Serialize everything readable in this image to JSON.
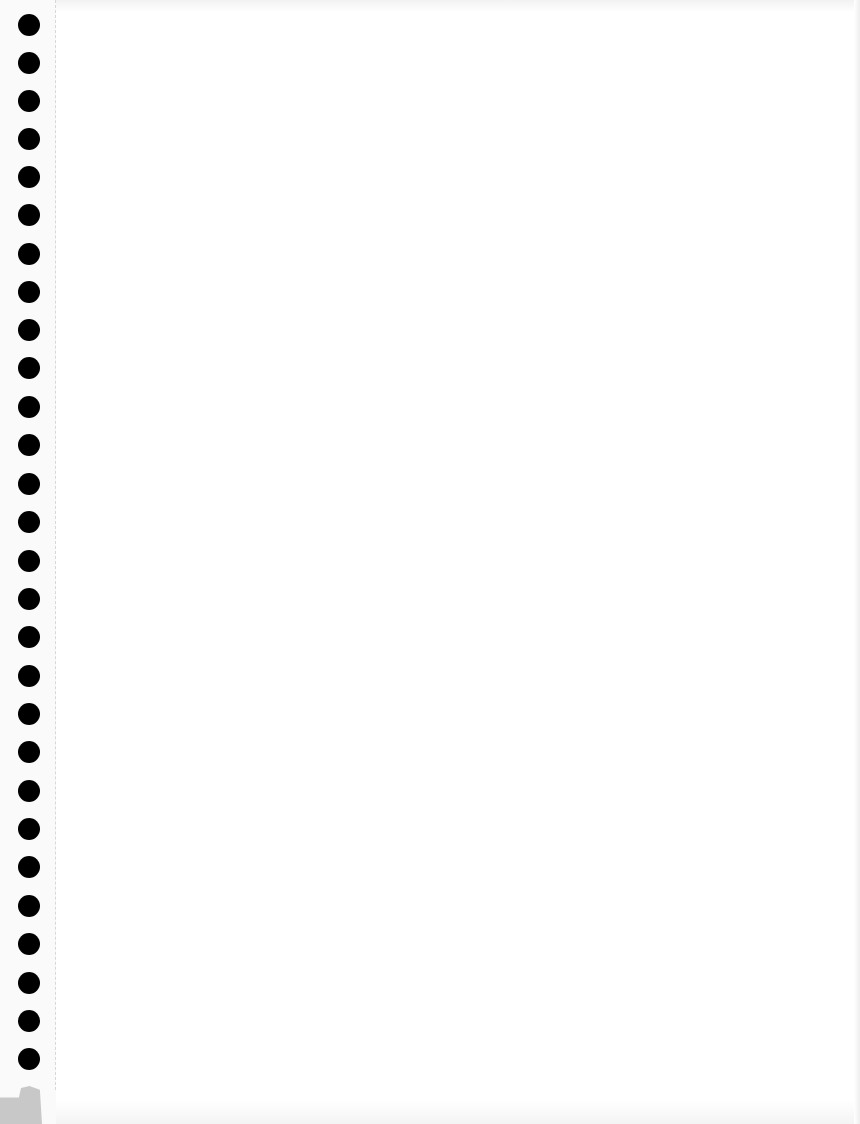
{
  "page": {
    "type": "blank-binder-paper",
    "background_color": "#ffffff",
    "hole_color": "#000000",
    "perforation_color": "#d8d8d8",
    "corner_shadow_color": "#c8c8c8",
    "hole_count": 28,
    "hole_center_x": 29,
    "hole_diameter": 22,
    "hole_centers_y": [
      25,
      63,
      101,
      139,
      177,
      215,
      254,
      292,
      330,
      368,
      407,
      445,
      484,
      522,
      561,
      599,
      637,
      676,
      714,
      752,
      791,
      829,
      867,
      906,
      944,
      983,
      1021,
      1059
    ],
    "text_content": ""
  }
}
